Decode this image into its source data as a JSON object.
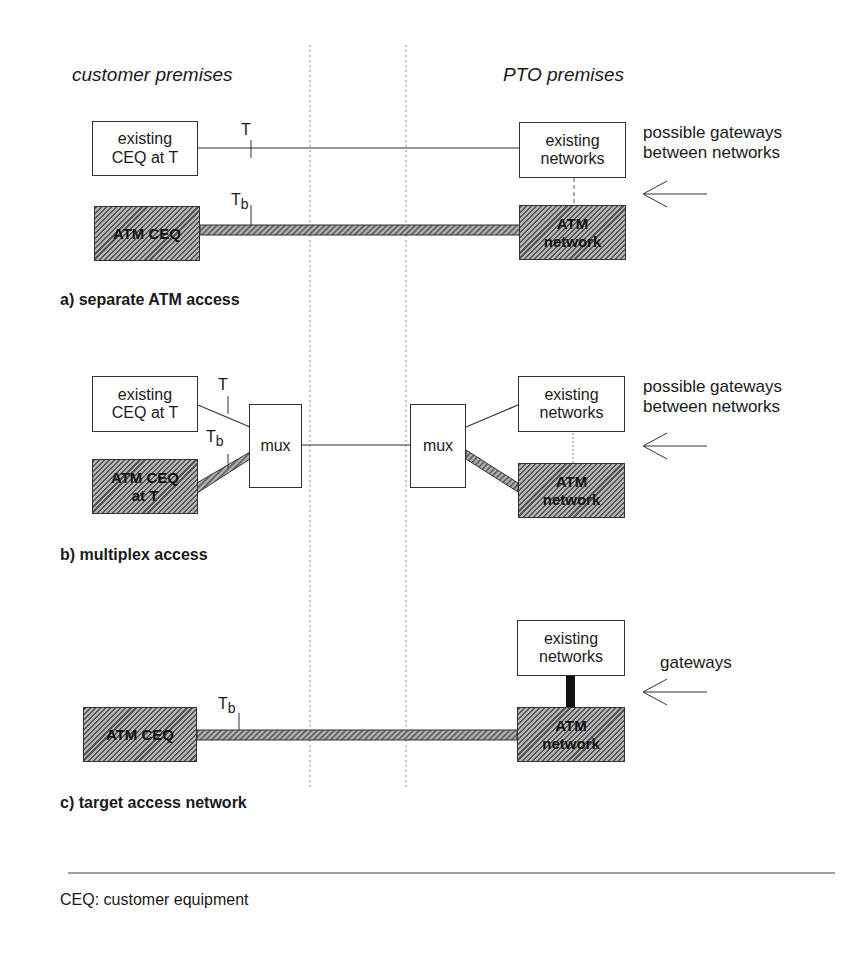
{
  "headers": {
    "left": "customer premises",
    "right": "PTO premises"
  },
  "panel_a": {
    "existing_ceq": "existing\nCEQ at T",
    "existing_networks": "existing\nnetworks",
    "atm_ceq": "ATM CEQ",
    "atm_network": "ATM\nnetwork",
    "t_label": "T",
    "tb_label_main": "T",
    "tb_label_sub": "b",
    "gateway_note": "possible gateways\nbetween networks",
    "caption": "a) separate ATM access"
  },
  "panel_b": {
    "existing_ceq": "existing\nCEQ at T",
    "atm_ceq": "ATM CEQ\nat T",
    "mux_left": "mux",
    "mux_right": "mux",
    "existing_networks": "existing\nnetworks",
    "atm_network": "ATM\nnetwork",
    "t_label": "T",
    "tb_label_main": "T",
    "tb_label_sub": "b",
    "gateway_note": "possible gateways\nbetween networks",
    "caption": "b) multiplex access"
  },
  "panel_c": {
    "atm_ceq": "ATM CEQ",
    "existing_networks": "existing\nnetworks",
    "atm_network": "ATM\nnetwork",
    "tb_label_main": "T",
    "tb_label_sub": "b",
    "gateway_note": "gateways",
    "caption": "c) target access network"
  },
  "footnote": "CEQ: customer equipment",
  "colors": {
    "line": "#333333",
    "hatch_dark": "#555555",
    "hatch_light": "#b5b5b5",
    "gateway_bar": "#111111"
  }
}
